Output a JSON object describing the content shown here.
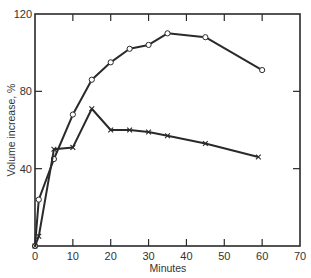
{
  "chart_data": {
    "type": "line",
    "title": "",
    "xlabel": "Minutes",
    "ylabel": "Volume increase, %",
    "xlim": [
      0,
      70
    ],
    "ylim": [
      0,
      120
    ],
    "x_ticks": [
      0,
      10,
      20,
      30,
      40,
      50,
      60,
      70
    ],
    "y_ticks": [
      40,
      80,
      120
    ],
    "grid": false,
    "legend": null,
    "series": [
      {
        "name": "circles",
        "marker": "circle",
        "x": [
          0,
          1,
          5,
          10,
          15,
          20,
          25,
          30,
          35,
          45,
          60
        ],
        "y": [
          0,
          24,
          45,
          68,
          86,
          95,
          102,
          104,
          110,
          108,
          91
        ]
      },
      {
        "name": "crosses",
        "marker": "x",
        "x": [
          0,
          1,
          5,
          10,
          15,
          20,
          25,
          30,
          35,
          45,
          59
        ],
        "y": [
          0,
          5,
          50,
          51,
          71,
          60,
          60,
          59,
          57,
          53,
          46
        ]
      }
    ]
  },
  "labels": {
    "xlabel": "Minutes",
    "ylabel": "Volume increase, %",
    "x_ticks": [
      "0",
      "10",
      "20",
      "30",
      "40",
      "50",
      "60",
      "70"
    ],
    "y_ticks": [
      "40",
      "80",
      "120"
    ]
  }
}
